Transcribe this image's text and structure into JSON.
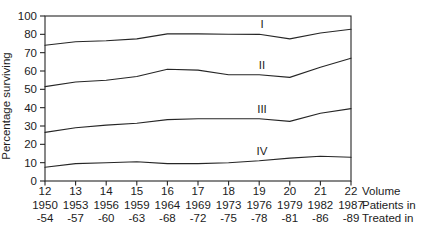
{
  "chart_data": {
    "type": "line",
    "title": "",
    "ylabel": "Percentage surviving",
    "xlabel": "",
    "grid": false,
    "legend_position": "inline-labels-above-lines",
    "y_ticks": [
      "0",
      "10",
      "20",
      "30",
      "40",
      "50",
      "60",
      "70",
      "80",
      "100"
    ],
    "y_tick_values": [
      0,
      10,
      20,
      30,
      40,
      50,
      60,
      70,
      80,
      100
    ],
    "y_axis_note": "ticks equally spaced; 90 omitted between 80 and 100",
    "x_rows": [
      {
        "right_label": "Volume",
        "values": [
          "12",
          "13",
          "14",
          "15",
          "16",
          "17",
          "18",
          "19",
          "20",
          "21",
          "22"
        ]
      },
      {
        "right_label": "Patients in",
        "values": [
          "1950",
          "1953",
          "1956",
          "1959",
          "1964",
          "1969",
          "1973",
          "1976",
          "1979",
          "1982",
          "1987"
        ]
      },
      {
        "right_label": "Treated in",
        "values": [
          "-54",
          "-57",
          "-60",
          "-63",
          "-68",
          "-72",
          "-75",
          "-78",
          "-81",
          "-86",
          "-89"
        ]
      }
    ],
    "series": [
      {
        "name": "I",
        "values": [
          74,
          76,
          76.5,
          77.5,
          80.5,
          80.5,
          80,
          80,
          77.5,
          81.5,
          85.5
        ]
      },
      {
        "name": "II",
        "values": [
          51.5,
          54,
          55,
          57,
          61,
          60.5,
          58,
          58,
          56.5,
          62,
          67
        ]
      },
      {
        "name": "III",
        "values": [
          26.5,
          29,
          30.5,
          31.5,
          33.5,
          34,
          34,
          34,
          32.5,
          37,
          39.5
        ]
      },
      {
        "name": "IV",
        "values": [
          7.5,
          9.5,
          10,
          10.5,
          9.5,
          9.5,
          10,
          11,
          12.5,
          13.5,
          13
        ]
      }
    ],
    "series_label_x": 262,
    "line_color": "#262626",
    "text_color": "#1c1c1c"
  }
}
